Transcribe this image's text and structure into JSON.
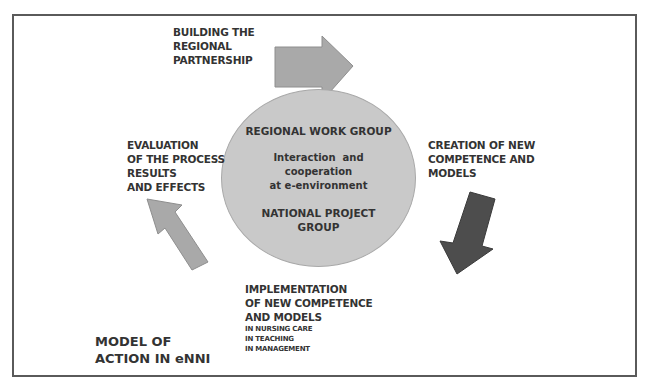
{
  "diagram": {
    "title": [
      "MODEL OF",
      "ACTION IN eNNI"
    ],
    "center": {
      "heading": "REGIONAL WORK GROUP",
      "middle": [
        "Interaction  and",
        "cooperation",
        "at e-environment"
      ],
      "footer": [
        "NATIONAL PROJECT",
        "GROUP"
      ]
    },
    "stages": {
      "building": [
        "BUILDING THE",
        "REGIONAL",
        "PARTNERSHIP"
      ],
      "creation": [
        "CREATION OF NEW",
        "COMPETENCE AND",
        "MODELS"
      ],
      "implementation": [
        "IMPLEMENTATION",
        "OF NEW COMPETENCE",
        "AND MODELS"
      ],
      "implementation_sub": [
        "IN NURSING CARE",
        "IN TEACHING",
        "IN MANAGEMENT"
      ],
      "evaluation": [
        "EVALUATION",
        "OF THE PROCESS",
        "RESULTS",
        "AND EFFECTS"
      ]
    },
    "arrows": [
      {
        "name": "arrow-right",
        "from": "building",
        "direction": "right",
        "color": "#a9a9a9"
      },
      {
        "name": "arrow-down-left",
        "from": "creation",
        "direction": "down-left",
        "color": "#4d4d4d"
      },
      {
        "name": "arrow-up-left",
        "from": "implementation",
        "direction": "up-left",
        "color": "#a9a9a9"
      }
    ],
    "colors": {
      "frame": "#5a5a5a",
      "ellipse_fill": "#c9c9c9",
      "text": "#333333"
    }
  }
}
